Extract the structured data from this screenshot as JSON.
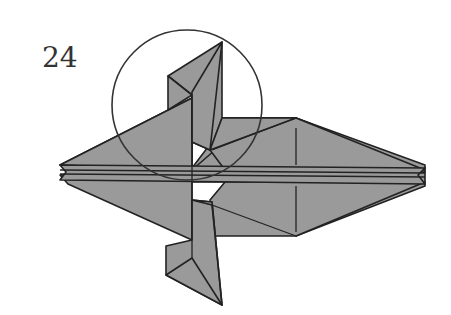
{
  "diagram": {
    "step_number": "24",
    "fill_color": "#9a9a9a",
    "line_color": "#222222",
    "highlight_circle": {
      "cx": 187,
      "cy": 105,
      "r": 75
    }
  }
}
